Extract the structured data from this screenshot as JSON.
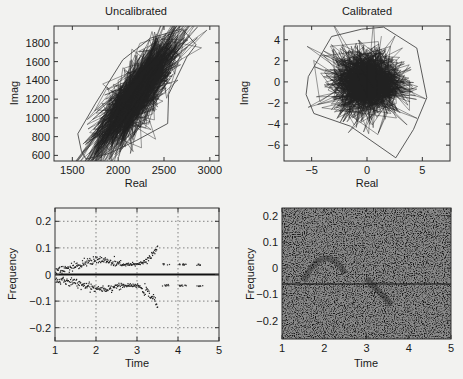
{
  "figure": {
    "panels": [
      {
        "id": "uncal",
        "title": "Uncalibrated",
        "xlabel": "Real",
        "ylabel": "Imag"
      },
      {
        "id": "cal",
        "title": "Calibrated",
        "xlabel": "Real",
        "ylabel": "Imag"
      },
      {
        "id": "tf1",
        "title": "",
        "xlabel": "Time",
        "ylabel": "Frequency"
      },
      {
        "id": "tf2",
        "title": "",
        "xlabel": "Time",
        "ylabel": "Frequency"
      }
    ]
  },
  "chart_data": [
    {
      "type": "line",
      "title": "Uncalibrated",
      "xlabel": "Real",
      "ylabel": "Imag",
      "xlim": [
        1300,
        3100
      ],
      "ylim": [
        540,
        1980
      ],
      "xticks": [
        1500,
        2000,
        2500,
        3000
      ],
      "yticks": [
        600,
        800,
        1000,
        1200,
        1400,
        1600,
        1800
      ],
      "grid": false,
      "description": "Dense connected scatter (random walk) of complex samples forming an elongated ellipse along a diagonal",
      "cloud": {
        "center": [
          2200,
          1250
        ],
        "axis_angle_deg": 48,
        "spread_major": 330,
        "spread_minor": 70
      },
      "extent": {
        "x": [
          1550,
          2850
        ],
        "y": [
          560,
          1950
        ]
      }
    },
    {
      "type": "line",
      "title": "Calibrated",
      "xlabel": "Real",
      "ylabel": "Imag",
      "xlim": [
        -7.5,
        7.5
      ],
      "ylim": [
        -7.5,
        5.3
      ],
      "xticks": [
        -5,
        0,
        5
      ],
      "yticks": [
        -6,
        -4,
        -2,
        0,
        2,
        4
      ],
      "grid": false,
      "description": "Dense connected scatter forming a roughly circular cloud centered near origin",
      "cloud": {
        "center": [
          0,
          0
        ],
        "radius_core": 3.5
      },
      "extent": {
        "x": [
          -5.5,
          5.5
        ],
        "y": [
          -7.2,
          5.2
        ]
      }
    },
    {
      "type": "scatter",
      "xlabel": "Time",
      "ylabel": "Frequency",
      "xlim": [
        1,
        5
      ],
      "ylim": [
        -0.25,
        0.25
      ],
      "xticks": [
        1,
        2,
        3,
        4,
        5
      ],
      "yticks": [
        -0.2,
        -0.1,
        0,
        0.1,
        0.2
      ],
      "grid": true,
      "horizontal_line": 0,
      "series": [
        {
          "name": "upper track",
          "points": [
            [
              1.0,
              0.02
            ],
            [
              1.5,
              0.03
            ],
            [
              1.8,
              0.05
            ],
            [
              2.0,
              0.06
            ],
            [
              2.3,
              0.05
            ],
            [
              2.5,
              0.04
            ],
            [
              3.0,
              0.04
            ],
            [
              3.2,
              0.05
            ],
            [
              3.4,
              0.08
            ],
            [
              3.5,
              0.11
            ],
            [
              4.0,
              0.04
            ],
            [
              4.7,
              0.04
            ]
          ]
        },
        {
          "name": "lower track",
          "points": [
            [
              1.0,
              -0.02
            ],
            [
              1.5,
              -0.03
            ],
            [
              1.8,
              -0.04
            ],
            [
              2.0,
              -0.05
            ],
            [
              2.3,
              -0.05
            ],
            [
              2.5,
              -0.04
            ],
            [
              3.0,
              -0.04
            ],
            [
              3.2,
              -0.06
            ],
            [
              3.4,
              -0.09
            ],
            [
              3.5,
              -0.12
            ],
            [
              4.0,
              -0.04
            ],
            [
              4.7,
              -0.04
            ]
          ]
        }
      ]
    },
    {
      "type": "heatmap",
      "xlabel": "Time",
      "ylabel": "Frequency",
      "xlim": [
        1,
        5
      ],
      "ylim": [
        -0.27,
        0.23
      ],
      "xticks": [
        1,
        2,
        3,
        4,
        5
      ],
      "yticks": [
        -0.2,
        -0.1,
        0,
        0.1,
        0.2
      ],
      "grid": false,
      "description": "Noisy time-frequency image with faint dark features: horizontal line near -0.06, arch near t=2 peaking ~0.05, descending streak near t=3.2 to -0.14",
      "features": [
        {
          "kind": "line",
          "freq": -0.06,
          "t": [
            1,
            5
          ]
        },
        {
          "kind": "arch",
          "t": [
            1.5,
            2.5
          ],
          "peak": 0.05
        },
        {
          "kind": "descending",
          "t": [
            3.0,
            3.6
          ],
          "freq": [
            -0.04,
            -0.14
          ]
        }
      ]
    }
  ]
}
